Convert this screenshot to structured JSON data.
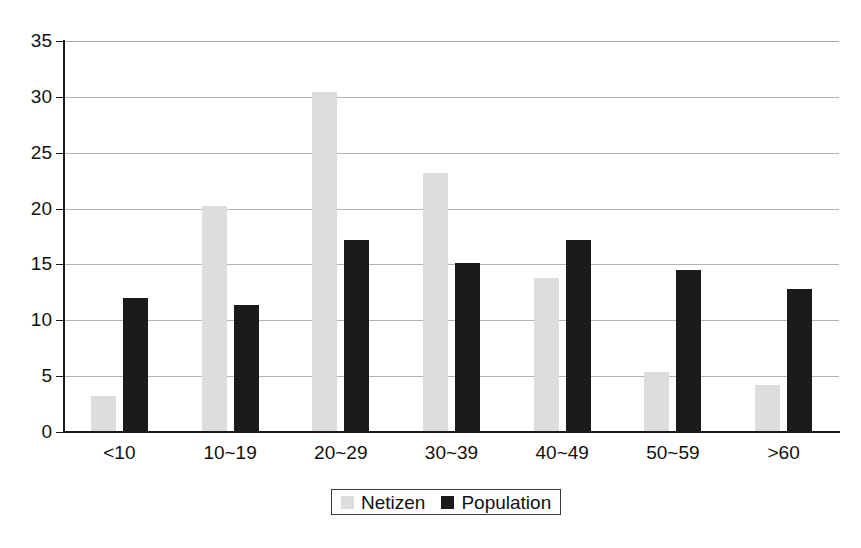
{
  "chart_data": {
    "type": "bar",
    "title": "",
    "subtitle": "",
    "xlabel": "",
    "ylabel": "",
    "categories": [
      "<10",
      "10~19",
      "20~29",
      "30~39",
      "40~49",
      "50~59",
      ">60"
    ],
    "series": [
      {
        "name": "Netizen",
        "color": "#dddddd",
        "values": [
          3.2,
          20.2,
          30.4,
          23.2,
          13.8,
          5.4,
          4.2
        ]
      },
      {
        "name": "Population",
        "color": "#1b1b1b",
        "values": [
          12.0,
          11.4,
          17.2,
          15.1,
          17.2,
          14.5,
          12.8
        ]
      }
    ],
    "ylim": [
      0,
      35
    ],
    "ytick_labels": [
      "0",
      "5",
      "10",
      "15",
      "20",
      "25",
      "30",
      "35"
    ],
    "ytick_values": [
      0,
      5,
      10,
      15,
      20,
      25,
      30,
      35
    ],
    "grid": true,
    "grid_axis": "y",
    "legend_position": "bottom-center",
    "legend_entries": [
      "Netizen",
      "Population"
    ]
  },
  "axis": {
    "y_min_label": "0",
    "y_max_label": "35"
  }
}
